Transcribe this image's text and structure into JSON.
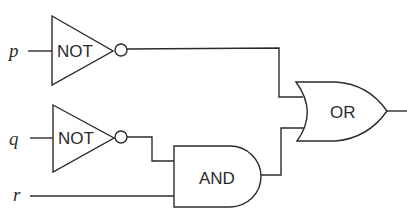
{
  "diagram": {
    "type": "logic-circuit",
    "inputs": [
      {
        "id": "p",
        "label": "p"
      },
      {
        "id": "q",
        "label": "q"
      },
      {
        "id": "r",
        "label": "r"
      }
    ],
    "gates": [
      {
        "id": "not1",
        "kind": "NOT",
        "label": "NOT",
        "input": "p"
      },
      {
        "id": "not2",
        "kind": "NOT",
        "label": "NOT",
        "input": "q"
      },
      {
        "id": "and1",
        "kind": "AND",
        "label": "AND",
        "inputs": [
          "not2",
          "r"
        ]
      },
      {
        "id": "or1",
        "kind": "OR",
        "label": "OR",
        "inputs": [
          "not1",
          "and1"
        ]
      }
    ],
    "output": "or1",
    "colors": {
      "stroke": "#2b2b2b",
      "background": "#ffffff"
    }
  }
}
